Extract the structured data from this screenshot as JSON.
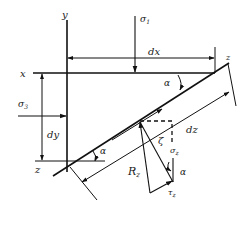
{
  "diagram": {
    "title": "",
    "labels": {
      "y_axis": "y",
      "x_axis": "x",
      "z_top": "z",
      "z_bottom": "z",
      "sigma1": "σ",
      "sigma1_sub": "1",
      "sigma3": "σ",
      "sigma3_sub": "3",
      "dx": "dx",
      "dy": "dy",
      "dz": "dz",
      "alpha_top": "α",
      "alpha_bottom": "α",
      "alpha_vector": "α",
      "R": "R",
      "R_sub": "z",
      "sigma_z": "σ",
      "sigma_z_sub": "z",
      "tau_z": "τ",
      "tau_z_sub": "z",
      "angle_mark": "ζ"
    },
    "colors": {
      "ink": "#111111",
      "background": "#ffffff"
    }
  }
}
